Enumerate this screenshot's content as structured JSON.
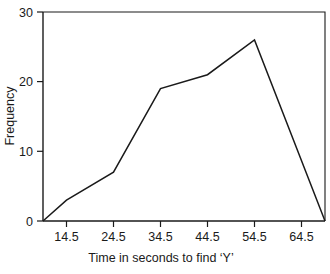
{
  "chart_data": {
    "type": "line",
    "title": "",
    "subtitle": "",
    "xlabel": "Time in seconds to find ‘Y’",
    "ylabel": "Frequency",
    "x": [
      9.5,
      14.5,
      24.5,
      34.5,
      44.5,
      54.5,
      69.5
    ],
    "values": [
      0,
      3,
      7,
      19,
      21,
      26,
      0
    ],
    "series": [
      {
        "name": "Frequency",
        "values": [
          0,
          3,
          7,
          19,
          21,
          26,
          0
        ]
      }
    ],
    "xticks": [
      14.5,
      24.5,
      34.5,
      44.5,
      54.5,
      64.5
    ],
    "xtick_labels": [
      "14.5",
      "24.5",
      "34.5",
      "44.5",
      "54.5",
      "64.5"
    ],
    "yticks": [
      0,
      10,
      20,
      30
    ],
    "ytick_labels": [
      "0",
      "10",
      "20",
      "30"
    ],
    "xlim": [
      9.5,
      69.5
    ],
    "ylim": [
      0,
      30
    ],
    "grid": false,
    "legend": false,
    "legend_position": "none",
    "line_color": "#1a1a1a",
    "background_color": "#ffffff",
    "axis_color": "#1a1a1a"
  },
  "axis": {
    "y_title": "Frequency",
    "x_title": "Time in seconds to find ‘Y’",
    "y_labels": {
      "t0": "0",
      "t1": "10",
      "t2": "20",
      "t3": "30"
    },
    "x_labels": {
      "t0": "14.5",
      "t1": "24.5",
      "t2": "34.5",
      "t3": "44.5",
      "t4": "54.5",
      "t5": "64.5"
    }
  }
}
